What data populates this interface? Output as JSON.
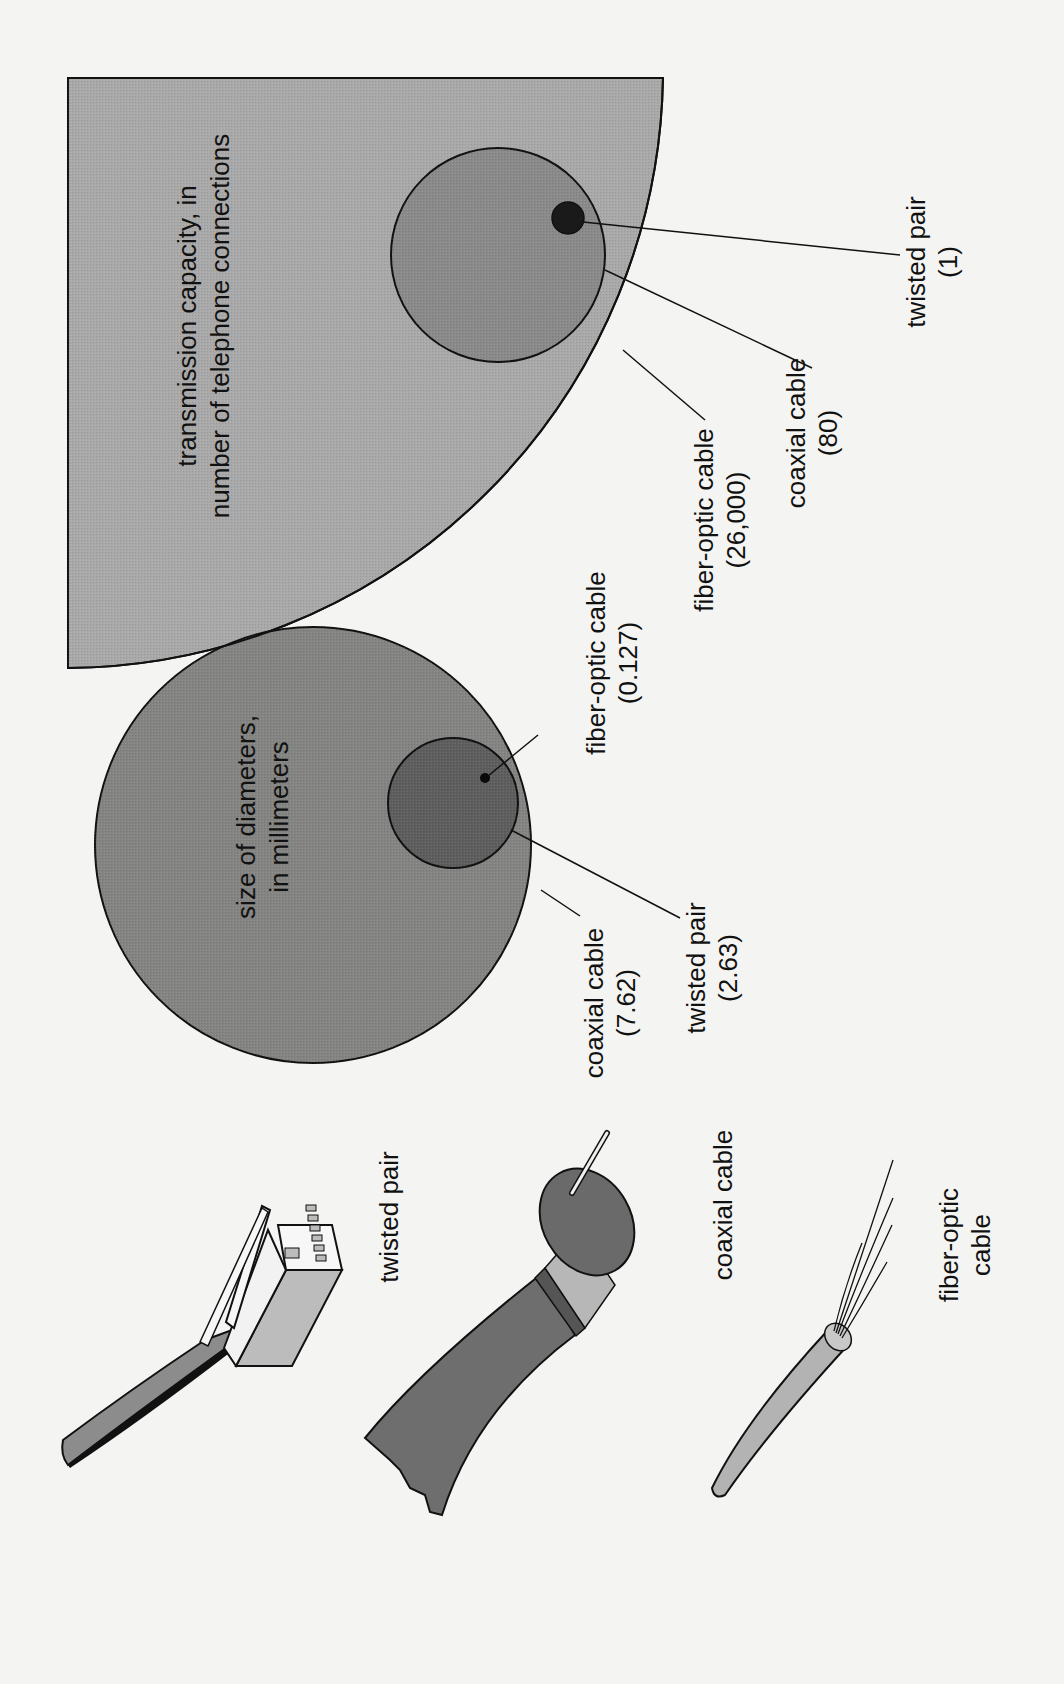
{
  "diagram": {
    "orientation": "rotated-90-ccw",
    "colors": {
      "background": "#f4f4f2",
      "capacity_region": "#a9a9a9",
      "capacity_coax_circle": "#8a8a8a",
      "capacity_twisted_dot": "#1a1a1a",
      "diameter_coax_circle": "#7a7a7a",
      "diameter_twisted_circle": "#5e5e5e",
      "diameter_fiber_dot": "#0a0a0a",
      "outline": "#111111"
    },
    "capacity_panel": {
      "title_line1": "transmission capacity, in",
      "title_line2": "number of telephone connections",
      "items": [
        {
          "label": "fiber-optic cable",
          "value": "(26,000)"
        },
        {
          "label": "coaxial cable",
          "value": "(80)"
        },
        {
          "label": "twisted pair",
          "value": "(1)"
        }
      ]
    },
    "diameter_panel": {
      "title_line1": "size of diameters,",
      "title_line2": "in millimeters",
      "items": [
        {
          "label": "coaxial cable",
          "value": "(7.62)"
        },
        {
          "label": "twisted pair",
          "value": "(2.63)"
        },
        {
          "label": "fiber-optic cable",
          "value": "(0.127)"
        }
      ]
    },
    "cable_illustrations": [
      {
        "name": "twisted pair",
        "label": "twisted pair"
      },
      {
        "name": "coaxial cable",
        "label": "coaxial cable"
      },
      {
        "name": "fiber-optic cable",
        "label_line1": "fiber-optic",
        "label_line2": "cable"
      }
    ]
  }
}
